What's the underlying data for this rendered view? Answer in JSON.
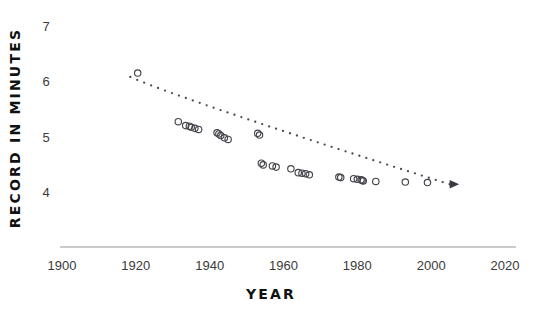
{
  "chart_data": {
    "type": "scatter",
    "title": "",
    "xlabel": "YEAR",
    "ylabel": "RECORD IN MINUTES",
    "xlim": [
      1895,
      2025
    ],
    "ylim": [
      3.72,
      7.15
    ],
    "grid": false,
    "legend": "none",
    "xticks": [
      1900,
      1920,
      1940,
      1960,
      1980,
      2000,
      2020
    ],
    "xtick_labels": [
      "1900",
      "1920",
      "1940",
      "1960",
      "1980",
      "2000",
      "2020"
    ],
    "yticks": [
      4,
      5,
      6,
      7
    ],
    "ytick_labels": [
      "4",
      "5",
      "6",
      "7"
    ],
    "marker": "open-circle",
    "annotations": [
      {
        "name": "trend-arrow",
        "text": "",
        "note": "dotted trend line ending in right-pointing arrowhead near 2005"
      }
    ],
    "series": [
      {
        "name": "Mile record",
        "x": [
          1920.5,
          1931.5,
          1933.5,
          1934.5,
          1935.0,
          1936.0,
          1937.0,
          1942.0,
          1942.5,
          1943.0,
          1944.0,
          1945.0,
          1953.0,
          1953.5,
          1954.0,
          1954.5,
          1957.0,
          1958.0,
          1962.0,
          1964.0,
          1965.0,
          1966.0,
          1967.0,
          1975.0,
          1975.5,
          1979.0,
          1980.0,
          1981.0,
          1981.3,
          1981.6,
          1985.0,
          1993.0,
          1999.0
        ],
        "y": [
          6.15,
          5.27,
          5.2,
          5.19,
          5.17,
          5.15,
          5.13,
          5.07,
          5.05,
          5.02,
          4.98,
          4.95,
          5.06,
          5.03,
          4.52,
          4.49,
          4.47,
          4.45,
          4.42,
          4.35,
          4.34,
          4.33,
          4.31,
          4.27,
          4.26,
          4.24,
          4.23,
          4.22,
          4.21,
          4.2,
          4.19,
          4.18,
          4.17
        ]
      }
    ],
    "trend": {
      "name": "dotted-trend-line",
      "x_start": 1918.5,
      "y_start": 6.08,
      "x_end": 2005.0,
      "y_end": 4.14,
      "style": "dotted",
      "arrowhead": true
    }
  }
}
